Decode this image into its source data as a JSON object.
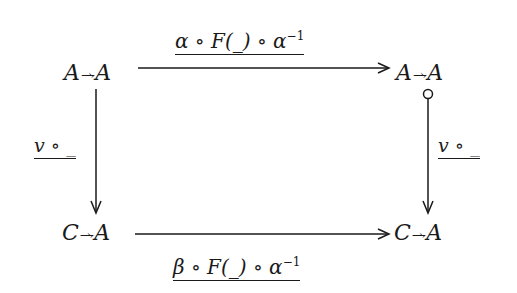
{
  "diagram": {
    "type": "commutative-square",
    "nodes": {
      "top_left": {
        "left": "A",
        "rel": "⇀⇁",
        "right": "A"
      },
      "top_right": {
        "left": "A",
        "rel": "⇀⇁",
        "right": "A"
      },
      "bottom_left": {
        "left": "C",
        "rel": "⇀⇁",
        "right": "A"
      },
      "bottom_right": {
        "left": "C",
        "rel": "⇀⇁",
        "right": "A"
      }
    },
    "edges": {
      "top": {
        "label_a": "α",
        "op1": " ∘ ",
        "label_f": "F(_)",
        "op2": " ∘ ",
        "label_b": "α",
        "sup": "−1"
      },
      "bottom": {
        "label_a": "β",
        "op1": " ∘ ",
        "label_f": "F(_)",
        "op2": " ∘ ",
        "label_b": "α",
        "sup": "−1"
      },
      "left": {
        "label_v": "v",
        "rest": " ∘ _"
      },
      "right": {
        "label_v": "v",
        "rest": " ∘ _",
        "tail": "circle"
      }
    },
    "line_color": "#1a1a1a"
  }
}
